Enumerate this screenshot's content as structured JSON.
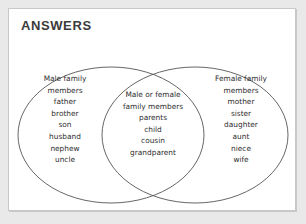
{
  "page": {
    "heading": "ANSWERS",
    "diagram_type": "venn-diagram-two-set",
    "outline_color": "#555555",
    "text_color": "#2e2e2e",
    "card_background": "#ffffff",
    "page_background": "#e9e9e9"
  },
  "venn": {
    "left_set": {
      "title_line_1": "Male family",
      "title_line_2": "members",
      "items": [
        "father",
        "brother",
        "son",
        "husband",
        "nephew",
        "uncle"
      ]
    },
    "intersection": {
      "title_line_1": "Male or female",
      "title_line_2": "family members",
      "items": [
        "parents",
        "child",
        "cousin",
        "grandparent"
      ]
    },
    "right_set": {
      "title_line_1": "Female family",
      "title_line_2": "members",
      "items": [
        "mother",
        "sister",
        "daughter",
        "aunt",
        "niece",
        "wife"
      ]
    }
  }
}
